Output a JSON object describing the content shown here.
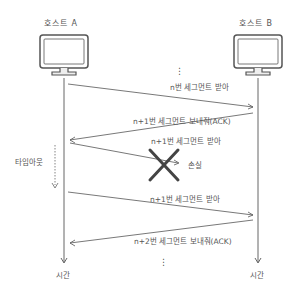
{
  "hosts": {
    "a": {
      "label": "호스트 A"
    },
    "b": {
      "label": "호스트 B"
    }
  },
  "messages": [
    {
      "id": "msg1",
      "label": "n번 세그먼트 받아",
      "direction": "A→B"
    },
    {
      "id": "msg2",
      "label": "n+1번 세그먼트 보내줘(ACK)",
      "direction": "B→A"
    },
    {
      "id": "msg3",
      "label": "n+1번 세그먼트 받아",
      "direction": "A→B",
      "lost": true
    },
    {
      "id": "msg4",
      "label": "n+1번 세그먼트 받아",
      "direction": "A→B"
    },
    {
      "id": "msg5",
      "label": "n+2번 세그먼트 보내줘(ACK)",
      "direction": "B→A"
    }
  ],
  "loss": {
    "label": "손실",
    "marker": "x-icon"
  },
  "timeout": {
    "label": "타임아웃"
  },
  "time_axis": {
    "a_label": "시간",
    "b_label": "시간"
  },
  "ellipsis": "⋮",
  "colors": {
    "line": "#555555",
    "cross": "#444444",
    "background": "#ffffff"
  }
}
